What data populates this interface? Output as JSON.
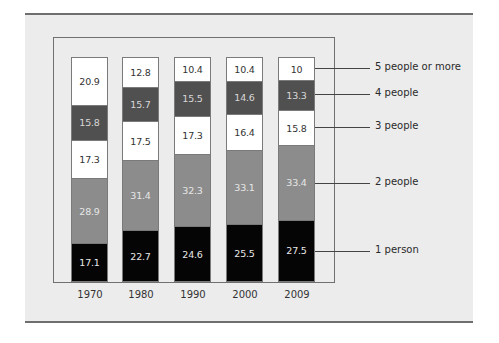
{
  "chart_data": {
    "type": "bar",
    "stacked": true,
    "title": "",
    "xlabel": "",
    "ylabel": "",
    "unit": "percent",
    "categories": [
      "1970",
      "1980",
      "1990",
      "2000",
      "2009"
    ],
    "series": [
      {
        "name": "1 person",
        "color": "#050505",
        "text_color": "#e8e8e8",
        "values": [
          17.1,
          22.7,
          24.6,
          25.5,
          27.5
        ]
      },
      {
        "name": "2 people",
        "color": "#8c8c8c",
        "text_color": "#e6e6e6",
        "values": [
          28.9,
          31.4,
          32.3,
          33.1,
          33.4
        ]
      },
      {
        "name": "3 people",
        "color": "#ffffff",
        "text_color": "#333333",
        "values": [
          17.3,
          17.5,
          17.3,
          16.4,
          15.8
        ]
      },
      {
        "name": "4 people",
        "color": "#505050",
        "text_color": "#d8d8d8",
        "values": [
          15.8,
          15.7,
          15.5,
          14.6,
          13.3
        ]
      },
      {
        "name": "5 people or more",
        "color": "#ffffff",
        "text_color": "#333333",
        "values": [
          20.9,
          12.8,
          10.4,
          10.4,
          10
        ]
      }
    ],
    "legend_position": "right",
    "grid": false
  },
  "years": [
    "1970",
    "1980",
    "1990",
    "2000",
    "2009"
  ],
  "legend": [
    "5 people or more",
    "4 people",
    "3 people",
    "2 people",
    "1 person"
  ]
}
